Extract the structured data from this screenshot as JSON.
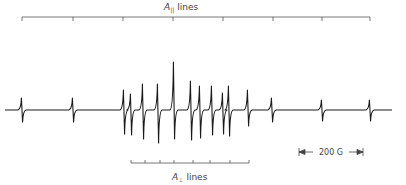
{
  "figure": {
    "parallel_label": {
      "symbol": "A",
      "subscript": "||",
      "text": "lines"
    },
    "perpendicular_label": {
      "symbol": "A",
      "subscript": "⊥",
      "text": "lines"
    },
    "scale_bar_label": "200 G",
    "colors": {
      "ink": "#1a1a1a",
      "ruler": "#555555",
      "text": "#444444"
    }
  },
  "parallel_ruler": {
    "x_start": 22,
    "x_end": 370,
    "y": 17,
    "ticks": [
      22,
      73,
      123,
      173,
      223,
      273,
      322,
      370
    ]
  },
  "perpendicular_ruler": {
    "x_start": 131,
    "x_end": 249,
    "y": 163,
    "ticks": [
      131,
      145,
      160,
      174,
      193,
      210,
      230,
      249
    ]
  },
  "scale_bar": {
    "x_start": 299,
    "x_end": 363,
    "y": 152
  },
  "spectrum": {
    "baseline_y": 110,
    "x_start": 5,
    "x_end": 392,
    "lines": [
      {
        "x": 22,
        "up": 12,
        "down": 12
      },
      {
        "x": 73,
        "up": 12,
        "down": 12
      },
      {
        "x": 124,
        "up": 20,
        "down": 24
      },
      {
        "x": 131,
        "up": 16,
        "down": 25
      },
      {
        "x": 143,
        "up": 26,
        "down": 29
      },
      {
        "x": 158,
        "up": 26,
        "down": 33
      },
      {
        "x": 174,
        "up": 48,
        "down": 29
      },
      {
        "x": 191,
        "up": 29,
        "down": 30
      },
      {
        "x": 200,
        "up": 24,
        "down": 28
      },
      {
        "x": 212,
        "up": 24,
        "down": 25
      },
      {
        "x": 223,
        "up": 17,
        "down": 24
      },
      {
        "x": 229,
        "up": 24,
        "down": 26
      },
      {
        "x": 248,
        "up": 20,
        "down": 16
      },
      {
        "x": 272,
        "up": 12,
        "down": 12
      },
      {
        "x": 322,
        "up": 10,
        "down": 11
      },
      {
        "x": 370,
        "up": 10,
        "down": 11
      }
    ]
  }
}
